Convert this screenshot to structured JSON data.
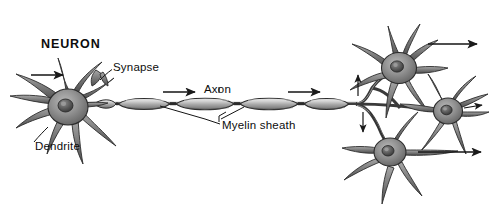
{
  "figure": {
    "title": "NEURON",
    "background_color": "#ffffff",
    "ink_color": "#1a1a1a",
    "cell_fill_color": "#8c8c8c",
    "nucleus_color": "#5a5a5a"
  },
  "labels": {
    "neuron": "NEURON",
    "synapse": "Synapse",
    "dendrite": "Dendrite",
    "axon": "Axon",
    "myelin_sheath": "Myelin sheath"
  },
  "structures": {
    "presynaptic_neuron": {
      "name": "presynaptic-neuron",
      "soma_center": [
        68,
        108
      ],
      "soma_radius": 19,
      "dendrite_count": 9
    },
    "axon": {
      "name": "axon",
      "start_x": 88,
      "end_x": 357,
      "y": 104,
      "myelin_segment_count": 5,
      "node_of_ranvier_count": 4
    },
    "postsynaptic_neurons": [
      {
        "name": "target-neuron-upper",
        "soma_center": [
          399,
          67
        ],
        "soma_radius": 17
      },
      {
        "name": "target-neuron-right",
        "soma_center": [
          448,
          112
        ],
        "soma_radius": 15
      },
      {
        "name": "target-neuron-lower",
        "soma_center": [
          390,
          152
        ],
        "soma_radius": 16
      }
    ]
  },
  "arrows": [
    {
      "name": "arrow-input-dendrite",
      "x1": 31,
      "y1": 75,
      "x2": 64,
      "y2": 75,
      "direction": "right"
    },
    {
      "name": "arrow-axon-left",
      "x1": 163,
      "y1": 92,
      "x2": 196,
      "y2": 92,
      "direction": "right"
    },
    {
      "name": "arrow-axon-right",
      "x1": 288,
      "y1": 92,
      "x2": 321,
      "y2": 92,
      "direction": "right"
    },
    {
      "name": "arrow-branch-up",
      "x1": 358,
      "y1": 96,
      "x2": 358,
      "y2": 74,
      "direction": "up"
    },
    {
      "name": "arrow-branch-down",
      "x1": 363,
      "y1": 112,
      "x2": 363,
      "y2": 133,
      "direction": "down"
    },
    {
      "name": "arrow-output-upper",
      "x1": 428,
      "y1": 44,
      "x2": 478,
      "y2": 44,
      "direction": "right"
    },
    {
      "name": "arrow-output-right",
      "x1": 464,
      "y1": 108,
      "x2": 483,
      "y2": 105,
      "direction": "right"
    },
    {
      "name": "arrow-output-lower",
      "x1": 418,
      "y1": 152,
      "x2": 482,
      "y2": 152,
      "direction": "right"
    }
  ],
  "leader_lines": {
    "synapse": {
      "name": "leader-synapse",
      "from": [
        112,
        70
      ],
      "to": [
        101,
        79
      ]
    },
    "dendrite": {
      "name": "leader-dendrite",
      "from": [
        34,
        142
      ],
      "to": [
        47,
        128
      ]
    },
    "myelin_left": {
      "name": "leader-myelin-left",
      "from": [
        220,
        124
      ],
      "to": [
        160,
        106
      ]
    },
    "myelin_right": {
      "name": "leader-myelin-right",
      "from": [
        228,
        121
      ],
      "to": [
        244,
        107
      ]
    },
    "myelin_tick": {
      "name": "leader-myelin-tick",
      "from": [
        221,
        117
      ],
      "to": [
        227,
        112
      ]
    }
  }
}
